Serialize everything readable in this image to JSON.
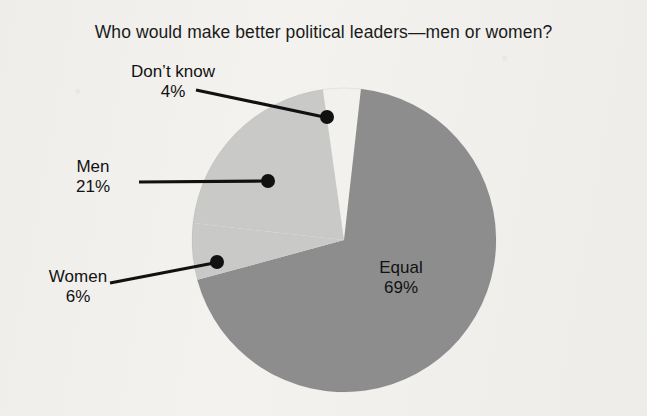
{
  "chart_data": {
    "type": "pie",
    "title": "Who would make better political leaders—men or women?",
    "categories": [
      "Don’t know",
      "Men",
      "Women",
      "Equal"
    ],
    "values": [
      4,
      21,
      6,
      69
    ],
    "unit": "%",
    "legend": "none",
    "slices": [
      {
        "label": "Don’t know",
        "value": 4,
        "value_text": "4%",
        "color": "#f2f1ee",
        "label_placement": "outside-left",
        "leader_dot": {
          "x": 327,
          "y": 117
        }
      },
      {
        "label": "Men",
        "value": 21,
        "value_text": "21%",
        "color": "#c9c9c7",
        "label_placement": "outside-left",
        "leader_dot": {
          "x": 268,
          "y": 181
        }
      },
      {
        "label": "Women",
        "value": 6,
        "value_text": "6%",
        "color": "#c9c9c7",
        "label_placement": "outside-left",
        "leader_dot": {
          "x": 217,
          "y": 262
        }
      },
      {
        "label": "Equal",
        "value": 69,
        "value_text": "69%",
        "color": "#8d8d8d",
        "label_placement": "inside",
        "leader_dot": null
      }
    ],
    "geometry": {
      "cx": 344,
      "cy": 240,
      "r": 152,
      "start_angle_deg": -8
    },
    "colors": {
      "background": "#f3f2ef",
      "text": "#121212",
      "leader_line": "#111111",
      "slice_dontknow": "#f2f1ee",
      "slice_men_women": "#c9c9c7",
      "slice_equal": "#8d8d8d"
    }
  },
  "labels": {
    "dontknow": {
      "name": "Don’t know",
      "pct": "4%"
    },
    "men": {
      "name": "Men",
      "pct": "21%"
    },
    "women": {
      "name": "Women",
      "pct": "6%"
    },
    "equal": {
      "name": "Equal",
      "pct": "69%"
    }
  }
}
